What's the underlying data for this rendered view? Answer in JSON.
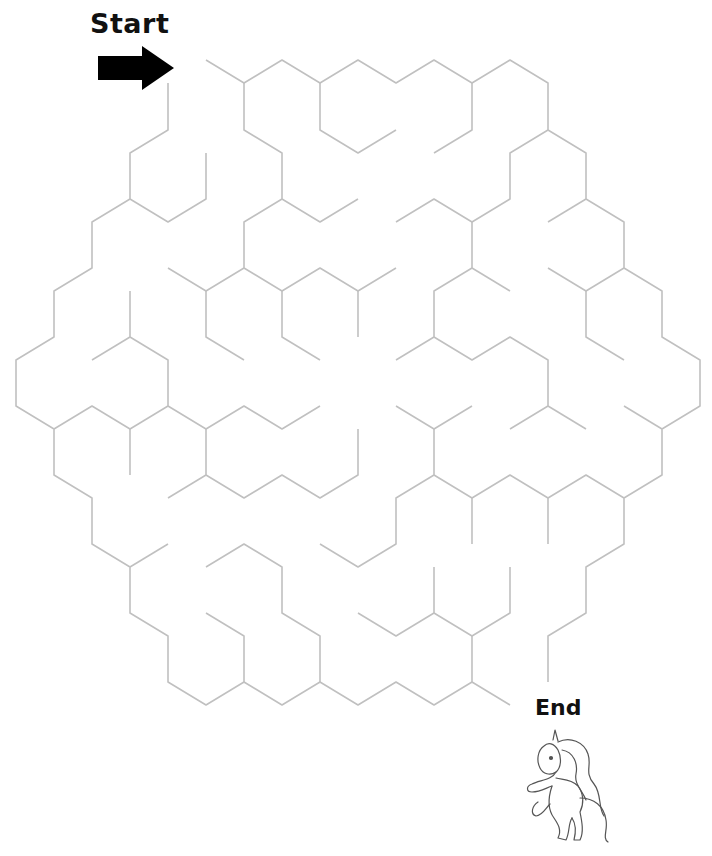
{
  "puzzle": {
    "type": "hexagonal maze",
    "start_label": "Start",
    "end_label": "End",
    "start_icon": "arrow-right-icon",
    "end_icon": "unicorn-icon",
    "wall_color": "#c0c0c0",
    "label_color": "#111111"
  },
  "maze": {
    "walls": [
      [
        [
          206,
          60
        ],
        [
          244,
          83
        ],
        [
          282,
          60
        ],
        [
          320,
          83
        ],
        [
          358,
          60
        ],
        [
          396,
          83
        ],
        [
          434,
          60
        ],
        [
          472,
          83
        ],
        [
          510,
          60
        ],
        [
          548,
          83
        ],
        [
          548,
          130
        ],
        [
          586,
          153
        ],
        [
          586,
          199
        ],
        [
          624,
          222
        ],
        [
          624,
          268
        ],
        [
          662,
          291
        ],
        [
          662,
          337
        ],
        [
          700,
          360
        ],
        [
          700,
          406
        ],
        [
          662,
          429
        ],
        [
          662,
          475
        ],
        [
          624,
          498
        ],
        [
          624,
          544
        ],
        [
          586,
          567
        ],
        [
          586,
          613
        ],
        [
          548,
          636
        ],
        [
          548,
          682
        ]
      ],
      [
        [
          244,
          83
        ],
        [
          244,
          130
        ],
        [
          282,
          153
        ],
        [
          282,
          199
        ],
        [
          320,
          222
        ],
        [
          358,
          199
        ]
      ],
      [
        [
          282,
          199
        ],
        [
          244,
          222
        ],
        [
          244,
          268
        ],
        [
          206,
          291
        ],
        [
          168,
          268
        ]
      ],
      [
        [
          206,
          291
        ],
        [
          206,
          337
        ],
        [
          244,
          360
        ]
      ],
      [
        [
          244,
          268
        ],
        [
          282,
          291
        ],
        [
          320,
          268
        ],
        [
          358,
          291
        ],
        [
          396,
          268
        ]
      ],
      [
        [
          358,
          291
        ],
        [
          358,
          337
        ]
      ],
      [
        [
          282,
          291
        ],
        [
          282,
          337
        ],
        [
          320,
          360
        ]
      ],
      [
        [
          320,
          83
        ],
        [
          320,
          130
        ],
        [
          358,
          153
        ],
        [
          396,
          130
        ]
      ],
      [
        [
          472,
          83
        ],
        [
          472,
          130
        ],
        [
          434,
          153
        ]
      ],
      [
        [
          548,
          130
        ],
        [
          510,
          153
        ],
        [
          510,
          199
        ],
        [
          472,
          222
        ],
        [
          434,
          199
        ],
        [
          396,
          222
        ]
      ],
      [
        [
          472,
          222
        ],
        [
          472,
          268
        ],
        [
          434,
          291
        ],
        [
          434,
          337
        ],
        [
          396,
          360
        ]
      ],
      [
        [
          472,
          268
        ],
        [
          510,
          291
        ]
      ],
      [
        [
          434,
          337
        ],
        [
          472,
          360
        ],
        [
          510,
          337
        ],
        [
          548,
          360
        ],
        [
          548,
          406
        ],
        [
          510,
          429
        ]
      ],
      [
        [
          548,
          406
        ],
        [
          586,
          429
        ]
      ],
      [
        [
          548,
          222
        ],
        [
          586,
          199
        ]
      ],
      [
        [
          624,
          268
        ],
        [
          586,
          291
        ],
        [
          548,
          268
        ]
      ],
      [
        [
          586,
          291
        ],
        [
          586,
          337
        ],
        [
          624,
          360
        ]
      ],
      [
        [
          624,
          406
        ],
        [
          662,
          429
        ]
      ],
      [
        [
          168,
          83
        ],
        [
          168,
          130
        ],
        [
          130,
          153
        ],
        [
          130,
          199
        ],
        [
          92,
          222
        ],
        [
          92,
          268
        ],
        [
          54,
          291
        ],
        [
          54,
          337
        ],
        [
          16,
          360
        ],
        [
          16,
          406
        ],
        [
          54,
          429
        ],
        [
          54,
          475
        ],
        [
          92,
          498
        ],
        [
          92,
          544
        ],
        [
          130,
          567
        ],
        [
          130,
          613
        ],
        [
          168,
          636
        ],
        [
          168,
          682
        ],
        [
          206,
          705
        ],
        [
          244,
          682
        ],
        [
          282,
          705
        ],
        [
          320,
          682
        ],
        [
          358,
          705
        ],
        [
          396,
          682
        ],
        [
          434,
          705
        ],
        [
          472,
          682
        ],
        [
          510,
          705
        ]
      ],
      [
        [
          130,
          199
        ],
        [
          168,
          222
        ],
        [
          206,
          199
        ],
        [
          206,
          153
        ]
      ],
      [
        [
          130,
          291
        ],
        [
          130,
          337
        ],
        [
          92,
          360
        ]
      ],
      [
        [
          130,
          337
        ],
        [
          168,
          360
        ],
        [
          168,
          406
        ],
        [
          130,
          429
        ],
        [
          92,
          406
        ],
        [
          54,
          429
        ]
      ],
      [
        [
          130,
          429
        ],
        [
          130,
          475
        ]
      ],
      [
        [
          168,
          406
        ],
        [
          206,
          429
        ],
        [
          244,
          406
        ],
        [
          282,
          429
        ],
        [
          320,
          406
        ]
      ],
      [
        [
          206,
          429
        ],
        [
          206,
          475
        ],
        [
          168,
          498
        ]
      ],
      [
        [
          206,
          475
        ],
        [
          244,
          498
        ],
        [
          282,
          475
        ],
        [
          320,
          498
        ],
        [
          358,
          475
        ],
        [
          358,
          429
        ]
      ],
      [
        [
          130,
          567
        ],
        [
          168,
          544
        ]
      ],
      [
        [
          206,
          567
        ],
        [
          244,
          544
        ],
        [
          282,
          567
        ],
        [
          282,
          613
        ],
        [
          320,
          636
        ],
        [
          320,
          682
        ]
      ],
      [
        [
          206,
          613
        ],
        [
          244,
          636
        ],
        [
          244,
          682
        ]
      ],
      [
        [
          396,
          406
        ],
        [
          434,
          429
        ],
        [
          472,
          406
        ]
      ],
      [
        [
          434,
          429
        ],
        [
          434,
          475
        ],
        [
          396,
          498
        ],
        [
          396,
          544
        ],
        [
          358,
          567
        ],
        [
          320,
          544
        ]
      ],
      [
        [
          434,
          475
        ],
        [
          472,
          498
        ],
        [
          510,
          475
        ],
        [
          548,
          498
        ],
        [
          586,
          475
        ],
        [
          624,
          498
        ]
      ],
      [
        [
          472,
          498
        ],
        [
          472,
          544
        ]
      ],
      [
        [
          548,
          498
        ],
        [
          548,
          544
        ]
      ],
      [
        [
          358,
          613
        ],
        [
          396,
          636
        ],
        [
          434,
          613
        ],
        [
          434,
          567
        ]
      ],
      [
        [
          434,
          613
        ],
        [
          472,
          636
        ],
        [
          510,
          613
        ],
        [
          510,
          567
        ]
      ],
      [
        [
          472,
          636
        ],
        [
          472,
          682
        ]
      ]
    ]
  }
}
